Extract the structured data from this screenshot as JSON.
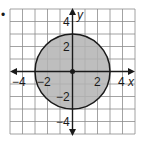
{
  "figure": {
    "bullet": "•",
    "x_axis_label": "x",
    "y_axis_label": "y",
    "x_ticks": [
      {
        "value": -4,
        "label": "−4"
      },
      {
        "value": -2,
        "label": "−2"
      },
      {
        "value": 2,
        "label": "2"
      },
      {
        "value": 4,
        "label": "4"
      }
    ],
    "y_ticks": [
      {
        "value": 4,
        "label": "4"
      },
      {
        "value": 2,
        "label": "2"
      },
      {
        "value": -2,
        "label": "−2"
      },
      {
        "value": -4,
        "label": "−4"
      }
    ],
    "grid": {
      "xmin": -5,
      "xmax": 5,
      "ymin": -5,
      "ymax": 5,
      "step": 1
    },
    "circle": {
      "center": [
        0,
        0
      ],
      "radius": 3,
      "fill": "#b3b3b3",
      "stroke": "#1a1a1a",
      "shaded": true
    },
    "center_point": {
      "x": 0,
      "y": 0
    },
    "colors": {
      "grid": "#8c8c8c",
      "axis": "#1a1a1a",
      "fill": "#b3b3b3"
    }
  }
}
